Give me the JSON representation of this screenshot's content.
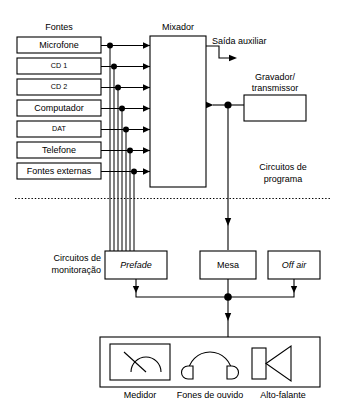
{
  "diagram": {
    "title_sources": "Fontes",
    "title_mixer": "Mixador",
    "sources": [
      {
        "label": "Microfone",
        "small": false
      },
      {
        "label": "CD 1",
        "small": true
      },
      {
        "label": "CD 2",
        "small": true
      },
      {
        "label": "Computador",
        "small": false
      },
      {
        "label": "DAT",
        "small": true
      },
      {
        "label": "Telefone",
        "small": false
      },
      {
        "label": "Fontes externas",
        "small": false
      }
    ],
    "mixer": {
      "label": "Mixador"
    },
    "aux_output": {
      "label": "Saída auxiliar"
    },
    "recorder": {
      "label_line1": "Gravador/",
      "label_line2": "transmissor"
    },
    "program_circuits": {
      "label_line1": "Circuitos de",
      "label_line2": "programa"
    },
    "monitoring_circuits": {
      "label_line1": "Circuitos de",
      "label_line2": "monitoração"
    },
    "monitor_boxes": [
      {
        "label": "Prefade",
        "italic": true
      },
      {
        "label": "Mesa",
        "italic": false
      },
      {
        "label": "Off air",
        "italic": true
      }
    ],
    "devices": [
      {
        "label": "Medidor",
        "icon": "vu-meter-icon"
      },
      {
        "label": "Fones de ouvido",
        "icon": "headphones-icon"
      },
      {
        "label": "Alto-falante",
        "icon": "loudspeaker-icon"
      }
    ],
    "colors": {
      "stroke": "#000000",
      "background": "#ffffff"
    }
  }
}
